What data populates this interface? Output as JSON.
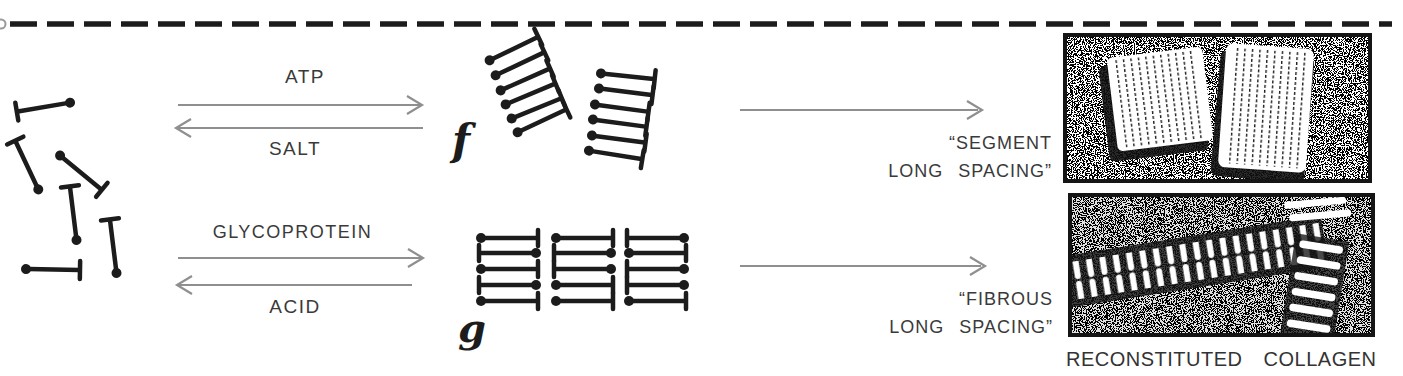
{
  "figure": {
    "caption": "RECONSTITUTED COLLAGEN"
  },
  "style": {
    "background": "#ffffff",
    "ink": "#1c1c1c",
    "arrow_gray": "#8f8f8f",
    "text_color": "#3a3a3a"
  },
  "monomer_pool": {
    "molecule_count": 6
  },
  "reaction_top": {
    "forward_label": "ATP",
    "reverse_label": "SALT",
    "product_label": "f",
    "product_group_count": 2,
    "molecules_per_group": 6,
    "result_line1": "“SEGMENT",
    "result_line2": "LONG SPACING”"
  },
  "reaction_bottom": {
    "forward_label": "GLYCOPROTEIN",
    "reverse_label": "ACID",
    "product_label": "g",
    "product_columns": 3,
    "product_rows": 5,
    "result_line1": "“FIBROUS",
    "result_line2": "LONG SPACING”"
  }
}
